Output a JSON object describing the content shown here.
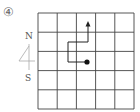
{
  "problem": {
    "number_label": "④"
  },
  "compass": {
    "north_label": "N",
    "south_label": "S"
  },
  "grid": {
    "rows": 5,
    "cols": 5,
    "origin_cell": {
      "col": 2,
      "row": 2
    },
    "path": [
      "start at dot (col 2, row 2 center)",
      "west 1",
      "north 1",
      "east 1",
      "north 1 (arrow end)"
    ]
  }
}
